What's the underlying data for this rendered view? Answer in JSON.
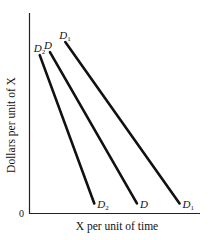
{
  "chart_data": {
    "type": "line",
    "title": "",
    "xlabel": "X per unit of time",
    "ylabel": "Dollars per unit of X",
    "origin_label": "0",
    "grid": false,
    "legend": "none (curves labeled directly at both ends)",
    "axis_ranges": {
      "x": [
        0,
        100
      ],
      "y": [
        0,
        100
      ]
    },
    "series": [
      {
        "name": "D2",
        "label_main": "D",
        "label_sub": "2",
        "points": [
          [
            6,
            79
          ],
          [
            38,
            5
          ]
        ]
      },
      {
        "name": "D",
        "label_main": "D",
        "label_sub": "",
        "points": [
          [
            12,
            80.5
          ],
          [
            63,
            5
          ]
        ]
      },
      {
        "name": "D1",
        "label_main": "D",
        "label_sub": "1",
        "points": [
          [
            21,
            85.5
          ],
          [
            88,
            5
          ]
        ]
      }
    ]
  },
  "colors": {
    "line": "#111111",
    "background": "#ffffff"
  }
}
